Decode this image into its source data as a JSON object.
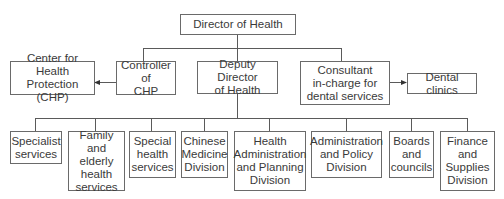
{
  "diagram": {
    "type": "org-chart",
    "top": {
      "label": "Director of Health"
    },
    "level2": [
      {
        "label": "Controller of CHP"
      },
      {
        "label": "Deputy Director of Health"
      },
      {
        "label": "Consultant in-charge for dental services"
      }
    ],
    "side": [
      {
        "label": "Center for Health Protection (CHP)",
        "from": "Controller of CHP"
      },
      {
        "label": "Dental clinics",
        "from": "Consultant in-charge for dental services"
      }
    ],
    "level3": [
      {
        "label": "Specialist services"
      },
      {
        "label": "Family and elderly health services"
      },
      {
        "label": "Special health services"
      },
      {
        "label": "Chinese Medicine Division"
      },
      {
        "label": "Health Administration and Planning Division"
      },
      {
        "label": "Administration and Policy Division"
      },
      {
        "label": "Boards and councils"
      },
      {
        "label": "Finance and Supplies Division"
      }
    ]
  },
  "text": {
    "director": "Director of Health",
    "chp_center": [
      "Center for Health",
      "Protection (CHP)"
    ],
    "controller": [
      "Controller of",
      "CHP"
    ],
    "deputy": [
      "Deputy Director",
      "of Health"
    ],
    "consultant": [
      "Consultant",
      "in-charge for",
      "dental services"
    ],
    "dental": "Dental clinics",
    "specialist": [
      "Specialist",
      "services"
    ],
    "family": [
      "Family and",
      "elderly",
      "health",
      "services"
    ],
    "special": [
      "Special",
      "health",
      "services"
    ],
    "chinese": [
      "Chinese",
      "Medicine",
      "Division"
    ],
    "hapd": [
      "Health",
      "Administration",
      "and Planning",
      "Division"
    ],
    "admin": [
      "Administration",
      "and Policy",
      "Division"
    ],
    "boards": [
      "Boards",
      "and",
      "councils"
    ],
    "finance": [
      "Finance",
      "and",
      "Supplies",
      "Division"
    ]
  },
  "colors": {
    "line": "#5a5a5a",
    "border": "#6a6a6a",
    "text": "#3a3a3a"
  }
}
